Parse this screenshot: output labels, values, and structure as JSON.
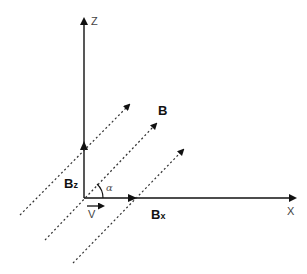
{
  "diagram": {
    "axes": {
      "z_label": "Z",
      "x_label": "X"
    },
    "vectors": {
      "b_field_label": "B",
      "bz_label_main": "B",
      "bz_label_sub": "z",
      "bx_label_main": "B",
      "bx_label_sub": "x",
      "velocity_label": "V"
    },
    "angle_label": "α",
    "colors": {
      "line": "#111111",
      "dashed": "#333333",
      "background": "#ffffff"
    }
  }
}
